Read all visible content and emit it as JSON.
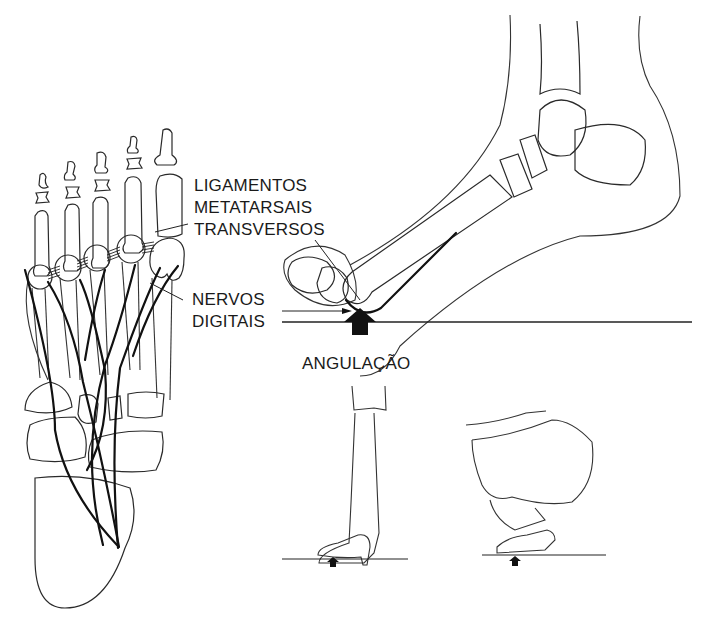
{
  "figure": {
    "labels": {
      "ligament_line1": "LIGAMENTOS",
      "ligament_line2": "METATARSAIS",
      "ligament_line3": "TRANSVERSOS",
      "nerve_line1": "NERVOS",
      "nerve_line2": "DIGITAIS",
      "angulation": "ANGULAÇÃO"
    },
    "panels": [
      {
        "id": "foot-plantar-view",
        "description": "Vista plantar do esqueleto do pé com nervos digitais e ligamentos metatarsais transversos"
      },
      {
        "id": "foot-lateral-view",
        "description": "Vista lateral do pé em flexão com seta de pressão na cabeça do metatarso"
      },
      {
        "id": "leg-high-heel",
        "description": "Perna com sapato de salto alto"
      },
      {
        "id": "squatting-figure",
        "description": "Figura agachada apoiada nos dedos"
      }
    ],
    "colors": {
      "ink": "#1a1a1a",
      "background": "#ffffff"
    }
  }
}
